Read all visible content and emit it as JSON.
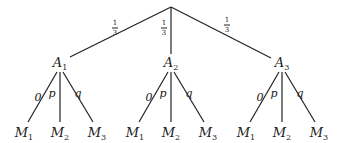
{
  "root": {
    "x": 171,
    "y": 7
  },
  "level1": [
    {
      "label": "A",
      "sub": "1",
      "x": 60,
      "y": 64,
      "edge_end": [
        70,
        57
      ],
      "prob": {
        "num": "1",
        "den": "3",
        "x": 115,
        "y": 28
      }
    },
    {
      "label": "A",
      "sub": "2",
      "x": 171,
      "y": 64,
      "edge_end": [
        171,
        54
      ],
      "prob": {
        "num": "1",
        "den": "3",
        "x": 164,
        "y": 28
      }
    },
    {
      "label": "A",
      "sub": "3",
      "x": 282,
      "y": 64,
      "edge_end": [
        271,
        58
      ],
      "prob": {
        "num": "1",
        "den": "3",
        "x": 227,
        "y": 25
      }
    }
  ],
  "level2_edge_labels": [
    "0",
    "p",
    "q"
  ],
  "level2_leaves": [
    {
      "label": "M",
      "sub": "1"
    },
    {
      "label": "M",
      "sub": "2"
    },
    {
      "label": "M",
      "sub": "3"
    }
  ],
  "colors": {
    "line": "#222222",
    "text": "#222222",
    "background": "#ffffff"
  }
}
